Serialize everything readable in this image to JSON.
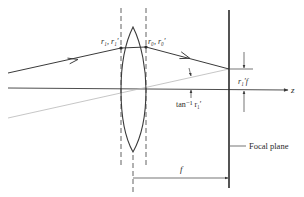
{
  "diagram": {
    "type": "thin-lens ray diagram",
    "labels": {
      "input_ray": "r₁, r₁′",
      "output_ray": "r₀, r₀′",
      "angle": "tan⁻¹ r₁′",
      "focal_offset": "r₁′f",
      "axis": "z",
      "focal_plane": "Focal plane",
      "focal_length": "f"
    },
    "colors": {
      "line": "#3a3a3a",
      "faint_line": "#b8b8b8",
      "background": "#ffffff"
    }
  }
}
